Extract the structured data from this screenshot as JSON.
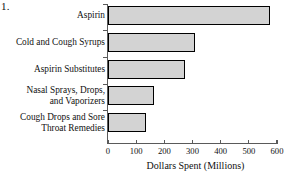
{
  "figure": {
    "item_number": "1."
  },
  "chart_data": {
    "type": "bar",
    "orientation": "horizontal",
    "title": "",
    "xlabel": "Dollars Spent (Millions)",
    "ylabel": "",
    "categories": [
      "Aspirin",
      "Cold and Cough Syrups",
      "Aspirin Substitutes",
      "Nasal Sprays, Drops, and Vaporizers",
      "Cough Drops and Sore Throat Remedies"
    ],
    "category_lines": [
      [
        "Aspirin"
      ],
      [
        "Cold and Cough Syrups"
      ],
      [
        "Aspirin Substitutes"
      ],
      [
        "Nasal Sprays, Drops,",
        "and Vaporizers"
      ],
      [
        "Cough Drops and Sore",
        "Throat Remedies"
      ]
    ],
    "values": [
      575,
      310,
      275,
      165,
      135
    ],
    "xlim": [
      0,
      600
    ],
    "xticks": [
      0,
      100,
      200,
      300,
      400,
      500,
      600
    ],
    "xtick_labels": [
      "0",
      "100",
      "200",
      "300",
      "400",
      "500",
      "600"
    ],
    "grid": false,
    "legend": null,
    "bar_fill_color": "#d3d3d3",
    "bar_edge_color": "#000000",
    "axis_color": "#5a5a5a"
  }
}
